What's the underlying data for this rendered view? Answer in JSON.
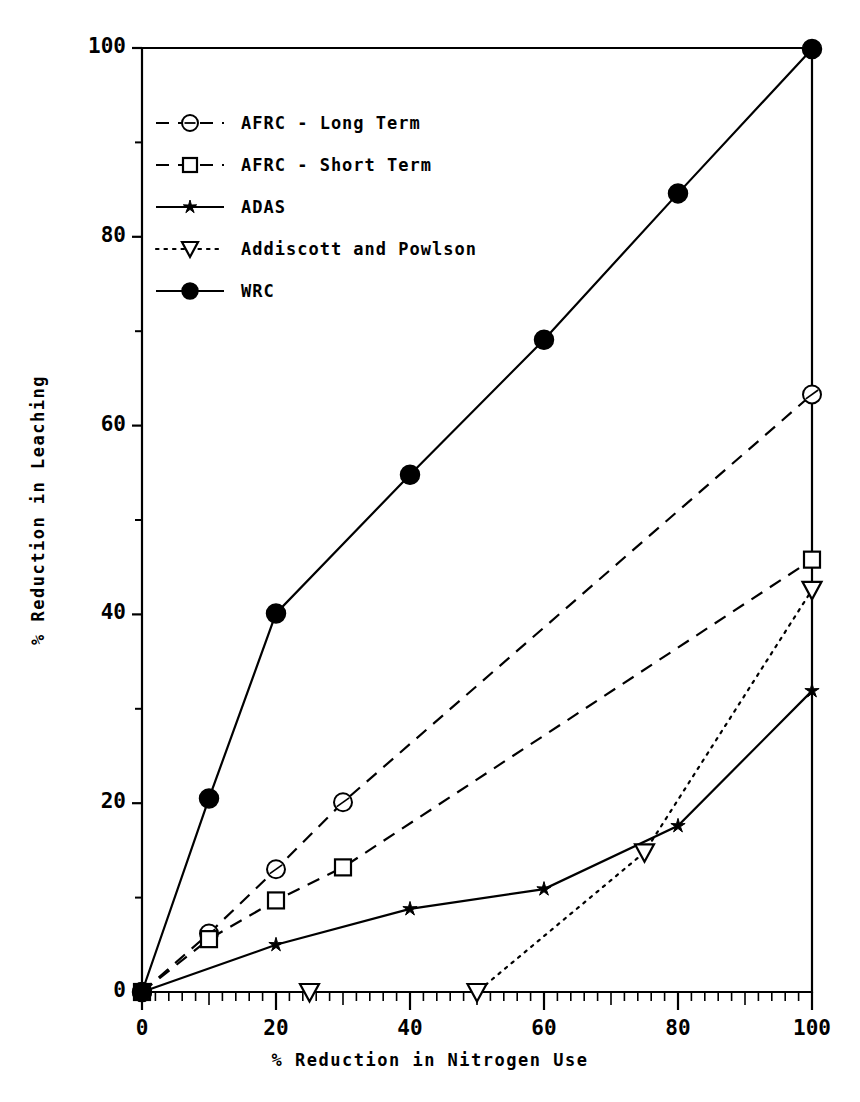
{
  "chart_data": {
    "type": "line",
    "title": "",
    "xlabel": "% Reduction in Nitrogen Use",
    "ylabel": "% Reduction in Leaching",
    "xlim": [
      0,
      100
    ],
    "ylim": [
      0,
      100
    ],
    "xticks": [
      0,
      20,
      40,
      60,
      80,
      100
    ],
    "yticks": [
      0,
      20,
      40,
      60,
      80,
      100
    ],
    "xtick_labels": [
      "0",
      "20",
      "40",
      "60",
      "80",
      "100"
    ],
    "ytick_labels": [
      "0",
      "20",
      "40",
      "60",
      "80",
      "100"
    ],
    "grid": false,
    "legend_position": "upper left",
    "series": [
      {
        "name": "AFRC - Long Term",
        "marker": "circle-open-slash",
        "linestyle": "dashed",
        "points": [
          [
            0,
            0
          ],
          [
            10,
            6.2
          ],
          [
            20,
            13.0
          ],
          [
            30,
            20.1
          ],
          [
            100,
            63.3
          ]
        ]
      },
      {
        "name": "AFRC - Short Term",
        "marker": "square-open",
        "linestyle": "dashed",
        "points": [
          [
            0,
            0
          ],
          [
            10,
            5.6
          ],
          [
            20,
            9.7
          ],
          [
            30,
            13.2
          ],
          [
            100,
            45.8
          ]
        ]
      },
      {
        "name": "ADAS",
        "marker": "star",
        "linestyle": "solid",
        "points": [
          [
            0,
            0
          ],
          [
            20,
            5.0
          ],
          [
            40,
            8.8
          ],
          [
            60,
            10.9
          ],
          [
            80,
            17.6
          ],
          [
            100,
            31.9
          ]
        ]
      },
      {
        "name": "Addiscott and Powlson",
        "marker": "triangle-down-open",
        "linestyle": "dotted",
        "points": [
          [
            25,
            0
          ],
          [
            50,
            0
          ],
          [
            75,
            14.8
          ],
          [
            100,
            42.6
          ]
        ]
      },
      {
        "name": "WRC",
        "marker": "circle-filled",
        "linestyle": "solid",
        "points": [
          [
            0,
            0
          ],
          [
            10,
            20.5
          ],
          [
            20,
            40.1
          ],
          [
            40,
            54.8
          ],
          [
            60,
            69.1
          ],
          [
            80,
            84.6
          ],
          [
            100,
            99.9
          ]
        ]
      }
    ]
  },
  "axis": {
    "x_label": "% Reduction in Nitrogen Use",
    "y_label": "% Reduction in Leaching"
  },
  "legend": {
    "entries": [
      {
        "label": "AFRC - Long Term"
      },
      {
        "label": "AFRC - Short Term"
      },
      {
        "label": "ADAS"
      },
      {
        "label": "Addiscott and Powlson"
      },
      {
        "label": "WRC"
      }
    ]
  },
  "colors": {
    "ink": "#000000",
    "background": "#ffffff"
  }
}
